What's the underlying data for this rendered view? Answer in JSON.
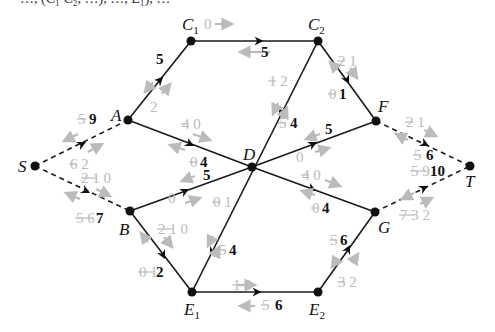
{
  "top_text_fragment": "…, (C₁ C₂, …), …, E₁), …",
  "colors": {
    "edge": "#1a1a1a",
    "faded_label": "#bbbbbb",
    "node": "#111111"
  },
  "nodes": [
    {
      "id": "S",
      "label": "S",
      "sub": "",
      "x": 35,
      "y": 166
    },
    {
      "id": "A",
      "label": "A",
      "sub": "",
      "x": 128,
      "y": 120
    },
    {
      "id": "B",
      "label": "B",
      "sub": "",
      "x": 130,
      "y": 211
    },
    {
      "id": "C1",
      "label": "C",
      "sub": "1",
      "x": 191,
      "y": 41
    },
    {
      "id": "C2",
      "label": "C",
      "sub": "2",
      "x": 318,
      "y": 41
    },
    {
      "id": "D",
      "label": "D",
      "sub": "",
      "x": 252,
      "y": 167
    },
    {
      "id": "F",
      "label": "F",
      "sub": "",
      "x": 376,
      "y": 121
    },
    {
      "id": "G",
      "label": "G",
      "sub": "",
      "x": 375,
      "y": 212
    },
    {
      "id": "T",
      "label": "T",
      "sub": "",
      "x": 470,
      "y": 166
    },
    {
      "id": "E1",
      "label": "E",
      "sub": "1",
      "x": 192,
      "y": 292
    },
    {
      "id": "E2",
      "label": "E",
      "sub": "2",
      "x": 318,
      "y": 292
    }
  ],
  "edges": [
    {
      "from": "S",
      "to": "A",
      "dashed": true,
      "forward_old": "6 2",
      "backward_old": "5",
      "flow": "9"
    },
    {
      "from": "S",
      "to": "B",
      "dashed": true,
      "forward_old": "2 1 0",
      "backward_old": "5 6",
      "flow": "7"
    },
    {
      "from": "A",
      "to": "C1",
      "dashed": false,
      "forward_old": "2",
      "backward_old": "",
      "flow": "5"
    },
    {
      "from": "A",
      "to": "D",
      "dashed": false,
      "forward_old": "4 0",
      "backward_old": "0",
      "flow": "4"
    },
    {
      "from": "B",
      "to": "D",
      "dashed": false,
      "forward_old": "0",
      "backward_old": "",
      "flow": "5"
    },
    {
      "from": "B",
      "to": "E1",
      "dashed": false,
      "forward_old": "2 1 0",
      "backward_old": "0 1",
      "flow": "2"
    },
    {
      "from": "C1",
      "to": "C2",
      "dashed": false,
      "forward_old": "0",
      "backward_old": "",
      "flow": "5"
    },
    {
      "from": "C2",
      "to": "D",
      "dashed": false,
      "forward_old": "1 2",
      "backward_old": "5",
      "flow": "4"
    },
    {
      "from": "C2",
      "to": "F",
      "dashed": false,
      "forward_old": "2 1",
      "backward_old": "0",
      "flow": "1"
    },
    {
      "from": "D",
      "to": "F",
      "dashed": false,
      "forward_old": "0",
      "backward_old": "",
      "flow": "5"
    },
    {
      "from": "D",
      "to": "G",
      "dashed": false,
      "forward_old": "4 0",
      "backward_old": "0",
      "flow": "4"
    },
    {
      "from": "D",
      "to": "E1",
      "dashed": false,
      "forward_old": "0 1",
      "backward_old": "5",
      "flow": "4"
    },
    {
      "from": "E1",
      "to": "E2",
      "dashed": false,
      "forward_old": "1 0",
      "backward_old": "5",
      "flow": "6"
    },
    {
      "from": "E2",
      "to": "G",
      "dashed": false,
      "forward_old": "3 2",
      "backward_old": "5",
      "flow": "6"
    },
    {
      "from": "F",
      "to": "T",
      "dashed": true,
      "forward_old": "2 1",
      "backward_old": "5",
      "flow": "6"
    },
    {
      "from": "G",
      "to": "T",
      "dashed": true,
      "forward_old": "7 3 2",
      "backward_old": "5 9",
      "flow": "10"
    }
  ],
  "labels": {
    "SA": {
      "old": "5",
      "flow": "9",
      "fwd_old": "6 2"
    },
    "SB": {
      "old": "2 1 0",
      "back_old": "5 6",
      "flow": "7"
    },
    "AC1": {
      "flow": "5",
      "old": "2"
    },
    "AD": {
      "fwd_old": "4 0",
      "back_old": "0",
      "flow": "4"
    },
    "BD": {
      "flow": "5",
      "old": "0"
    },
    "BE1": {
      "fwd_old": "2 1 0",
      "back_old": "0 1",
      "flow": "2"
    },
    "C1C2": {
      "fwd_old": "0",
      "flow": "5"
    },
    "C2D": {
      "fwd_old": "1 2",
      "back_old": "5",
      "flow": "4"
    },
    "C2F": {
      "fwd_old": "2 1",
      "back_old": "0",
      "flow": "1"
    },
    "DF": {
      "flow": "5",
      "old": "0"
    },
    "DG": {
      "fwd_old": "4 0",
      "back_old": "0",
      "flow": "4"
    },
    "DE1": {
      "fwd_old": "0 1",
      "back_old": "5",
      "flow": "4"
    },
    "E1E2": {
      "fwd_old": "1 0",
      "back_old": "5",
      "flow": "6"
    },
    "E2G": {
      "back_old": "5",
      "flow": "6",
      "fwd_old": "3 2"
    },
    "FT": {
      "fwd_old": "2 1",
      "back_old": "5",
      "flow": "6"
    },
    "GT": {
      "back_old": "5 9",
      "flow": "10",
      "fwd_old": "7 3 2"
    }
  }
}
